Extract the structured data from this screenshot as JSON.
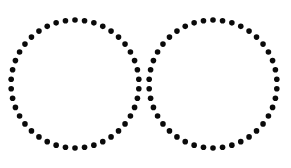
{
  "image": {
    "width": 291,
    "height": 168,
    "background_color": "#ffffff",
    "description": "Two overlapping circles outlined with evenly spaced round dots"
  },
  "chart_data": {
    "type": "scatter",
    "title": "",
    "subtitle": "",
    "xlabel": "",
    "ylabel": "",
    "xlim": [
      0,
      291
    ],
    "ylim": [
      0,
      168
    ],
    "grid": false,
    "legend": null,
    "axes_visible": false,
    "tick_labels": {
      "x": [],
      "y": []
    },
    "annotations": [],
    "marker": {
      "shape": "circle",
      "diameter_px": 5.6,
      "color": "#0a0a0a"
    },
    "series": [
      {
        "name": "left-circle",
        "shape": "circle",
        "center_x": 75,
        "center_y": 84,
        "radius": 64,
        "dot_count": 42,
        "start_angle_deg": -90,
        "color": "#0a0a0a"
      },
      {
        "name": "right-circle",
        "shape": "circle",
        "center_x": 213,
        "center_y": 84,
        "radius": 64,
        "dot_count": 42,
        "start_angle_deg": -90,
        "color": "#0a0a0a"
      }
    ],
    "intersections": [
      {
        "name": "upper-intersection",
        "x": 144,
        "y": 44
      },
      {
        "name": "lower-intersection",
        "x": 144,
        "y": 124
      }
    ]
  }
}
